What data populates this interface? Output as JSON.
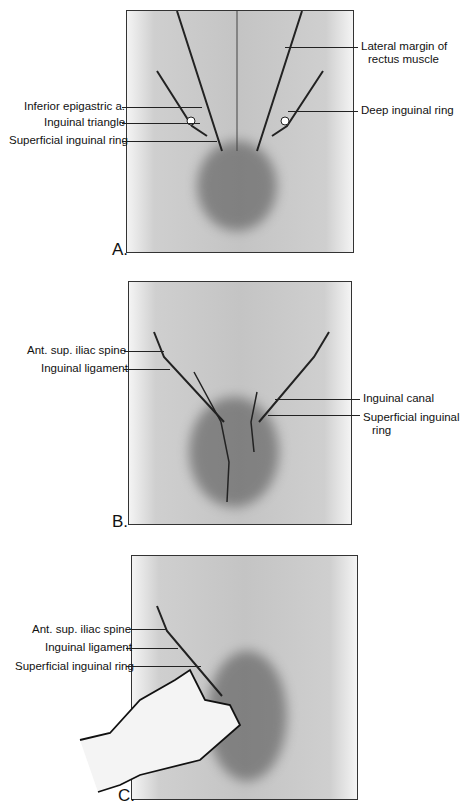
{
  "figure": {
    "panels": [
      {
        "letter": "A.",
        "labels_left": [
          "Inferior epigastric a.",
          "Inguinal triangle",
          "Superficial inguinal ring"
        ],
        "labels_right": [
          "Lateral margin of",
          "rectus muscle",
          "Deep inguinal ring"
        ]
      },
      {
        "letter": "B.",
        "labels_left": [
          "Ant. sup. iliac spine",
          "Inguinal ligament"
        ],
        "labels_right": [
          "Inguinal canal",
          "Superficial inguinal",
          "ring"
        ]
      },
      {
        "letter": "C.",
        "labels_left": [
          "Ant. sup. iliac spine",
          "Inguinal ligament",
          "Superficial inguinal ring"
        ],
        "labels_right": []
      }
    ]
  }
}
